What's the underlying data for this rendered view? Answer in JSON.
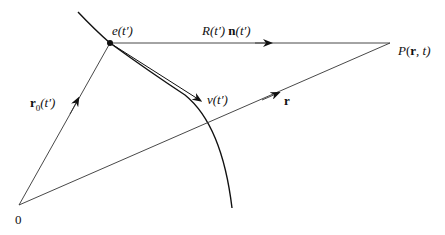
{
  "diagram": {
    "colors": {
      "background": "#ffffff",
      "stroke": "#111111"
    },
    "points": {
      "origin": {
        "label": "0",
        "x": 19,
        "y": 205
      },
      "charge": {
        "label_prefix": "e",
        "label_arg": "(t′)",
        "x": 110,
        "y": 43
      },
      "field_point": {
        "label_prefix": "P",
        "label_open": "(",
        "label_bold": "r",
        "label_rest": ", t)",
        "x": 390,
        "y": 43
      }
    },
    "vectors": {
      "r0": {
        "label_bold": "r",
        "label_sub": "0",
        "label_arg": "(t′)"
      },
      "r": {
        "label_bold": "r"
      },
      "Rn": {
        "label_R": "R(t′)",
        "label_bold": "n",
        "label_arg": "(t′)"
      },
      "v": {
        "label_v": "v",
        "label_arg": "(t′)"
      }
    },
    "curve": {
      "name": "trajectory",
      "description": "path of the charge"
    }
  }
}
